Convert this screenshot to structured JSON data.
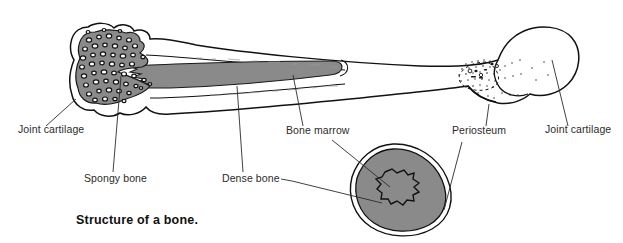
{
  "figure": {
    "caption": "Structure of a bone.",
    "title": "Structure of a bone",
    "background_color": "#ffffff",
    "outline_color": "#111111",
    "bone_fill_color": "#ffffff",
    "marrow_fill_color": "#8a8a8a",
    "spongy_fill_color": "#8a8a8a",
    "dense_bone_fill_color": "#8a8a8a",
    "label_color": "#2b2b2b",
    "labels": [
      {
        "id": "joint-cartilage-left",
        "text": "Joint cartilage",
        "x": 18,
        "y": 133
      },
      {
        "id": "spongy-bone",
        "text": "Spongy bone",
        "x": 84,
        "y": 182
      },
      {
        "id": "dense-bone",
        "text": "Dense bone",
        "x": 222,
        "y": 182
      },
      {
        "id": "bone-marrow",
        "text": "Bone marrow",
        "x": 286,
        "y": 134
      },
      {
        "id": "periosteum",
        "text": "Periosteum",
        "x": 452,
        "y": 134
      },
      {
        "id": "joint-cartilage-right",
        "text": "Joint cartilage",
        "x": 545,
        "y": 133
      }
    ],
    "parts": [
      {
        "id": "long-bone",
        "name": "long bone longitudinal section"
      },
      {
        "id": "left-epiphysis",
        "name": "left epiphysis with spongy bone"
      },
      {
        "id": "shaft",
        "name": "bone shaft with marrow cavity"
      },
      {
        "id": "right-epiphysis",
        "name": "right epiphysis head"
      },
      {
        "id": "cross-section",
        "name": "bone cross section"
      }
    ]
  }
}
